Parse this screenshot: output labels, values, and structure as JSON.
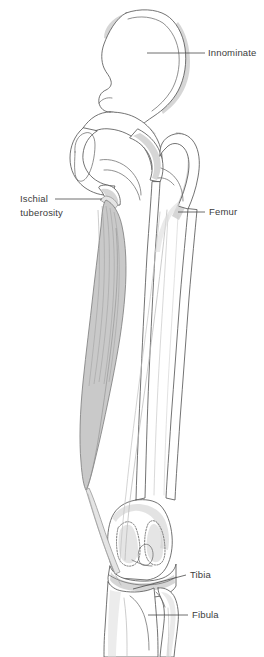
{
  "figure": {
    "view": "anterior",
    "background_color": "#ffffff",
    "line_color": "#5a5a5a",
    "shade_color": "#cfcfcf",
    "muscle_color": "#c9c9c9",
    "text_color": "#3c3c3c"
  },
  "labels": [
    {
      "id": "innominate",
      "text": "Innominate",
      "text_x": 208,
      "text_y": 56,
      "anchor": "start",
      "lines": 1
    },
    {
      "id": "ischial-tuberosity",
      "text_line_1": "Ischial",
      "text_line_2": "tuberosity",
      "text_x": 48,
      "text_y": 202,
      "anchor": "end",
      "lines": 2
    },
    {
      "id": "femur",
      "text": "Femur",
      "text_x": 209,
      "text_y": 215,
      "anchor": "start",
      "lines": 1
    },
    {
      "id": "tibia",
      "text": "Tibia",
      "text_x": 190,
      "text_y": 578,
      "anchor": "start",
      "lines": 1
    },
    {
      "id": "fibula",
      "text": "Fibula",
      "text_x": 192,
      "text_y": 618,
      "anchor": "start",
      "lines": 1
    }
  ],
  "structures": [
    {
      "id": "innominate-bone",
      "name": "Innominate"
    },
    {
      "id": "ischial-tuberosity-bone",
      "name": "Ischial tuberosity"
    },
    {
      "id": "femur-bone",
      "name": "Femur"
    },
    {
      "id": "tibia-bone",
      "name": "Tibia"
    },
    {
      "id": "fibula-bone",
      "name": "Fibula"
    },
    {
      "id": "hamstring-muscle",
      "name": "Hamstring muscle belly"
    }
  ]
}
